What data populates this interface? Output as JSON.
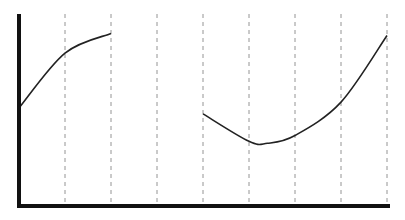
{
  "chart_data": {
    "type": "line",
    "title": "",
    "xlabel": "",
    "ylabel": "",
    "grid": {
      "vertical_dashed": true,
      "horizontal": false
    },
    "legend": null,
    "x": [
      0,
      1,
      2,
      3,
      4,
      5,
      6,
      7,
      8
    ],
    "series": [
      {
        "name": "segment-1",
        "x": [
          0,
          1,
          2
        ],
        "values": [
          0.5,
          0.78,
          0.88
        ]
      },
      {
        "name": "segment-2",
        "x": [
          4,
          5,
          5.4,
          6,
          7,
          8
        ],
        "values": [
          0.47,
          0.33,
          0.32,
          0.36,
          0.53,
          0.87
        ]
      }
    ],
    "ylim": [
      0,
      1
    ],
    "colors": {
      "axis": "#111111",
      "line": "#222222",
      "grid": "#888888"
    }
  }
}
